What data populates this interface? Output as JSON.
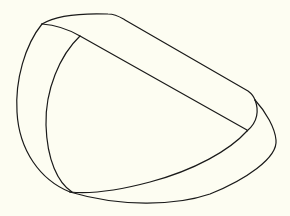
{
  "figure": {
    "background_color": "#fdfdf2",
    "stroke_color": "#1a1a1a",
    "stroke_width": 1.2
  }
}
